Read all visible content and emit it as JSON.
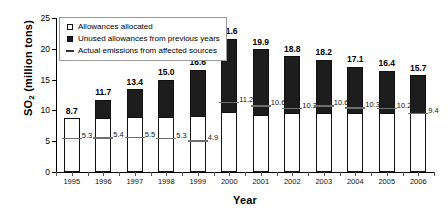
{
  "chart_data": {
    "type": "bar",
    "subtype": "stacked-bar-with-marker",
    "title": "",
    "xlabel": "Year",
    "ylabel": "SO2 (million tons)",
    "ylabel_base": "SO",
    "ylabel_sub": "2",
    "ylabel_rest": " (million tons)",
    "ylim": [
      0,
      25
    ],
    "yticks": [
      0,
      5,
      10,
      15,
      20,
      25
    ],
    "grid": false,
    "legend_position": "top-left",
    "categories": [
      "1995",
      "1996",
      "1997",
      "1998",
      "1999",
      "2000",
      "2001",
      "2002",
      "2003",
      "2004",
      "2005",
      "2006"
    ],
    "series": [
      {
        "name": "Allowances allocated",
        "marker": "open-square",
        "color": "#ffffff",
        "values": [
          8.7,
          8.8,
          8.9,
          9.0,
          9.1,
          9.7,
          9.3,
          9.5,
          9.5,
          9.6,
          9.6,
          9.5
        ]
      },
      {
        "name": "Unused allowances from previous years",
        "marker": "filled-square",
        "color": "#1d1d1d",
        "values": [
          0.0,
          2.9,
          4.5,
          6.0,
          7.5,
          11.9,
          10.6,
          9.3,
          8.7,
          7.5,
          6.8,
          6.2
        ]
      },
      {
        "name": "Actual emissions from affected sources",
        "marker": "dash",
        "color": "#6e6e6e",
        "values": [
          5.3,
          5.4,
          5.5,
          5.3,
          4.9,
          11.2,
          10.6,
          10.2,
          10.6,
          10.3,
          10.2,
          9.4
        ]
      }
    ],
    "total_labels": [
      "8.7",
      "11.7",
      "13.4",
      "15.0",
      "16.6",
      "21.6",
      "19.9",
      "18.8",
      "18.2",
      "17.1",
      "16.4",
      "15.7"
    ],
    "emission_labels": [
      "5.3",
      "5.4",
      "5.5",
      "5.3",
      "4.9",
      "11.2",
      "10.6",
      "10.2",
      "10.6",
      "10.3",
      "10.2",
      "9.4"
    ],
    "totals": [
      8.7,
      11.7,
      13.4,
      15.0,
      16.6,
      21.6,
      19.9,
      18.8,
      18.2,
      17.1,
      16.4,
      15.7
    ]
  },
  "legend": {
    "items": [
      {
        "label": "Allowances allocated",
        "swatch": "open-square"
      },
      {
        "label": "Unused allowances from previous years",
        "swatch": "filled-square"
      },
      {
        "label": "Actual emissions from affected sources",
        "swatch": "dash"
      }
    ]
  }
}
